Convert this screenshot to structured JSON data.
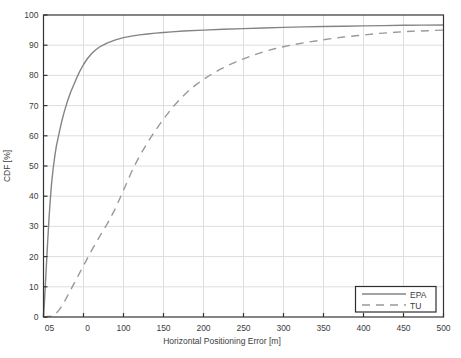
{
  "chart_data": {
    "type": "line",
    "title": "",
    "xlabel": "Horizontal Positioning Error [m]",
    "ylabel": "CDF [%]",
    "xlim": [
      0,
      500
    ],
    "ylim": [
      0,
      100
    ],
    "grid": true,
    "x_tick_values": [
      0,
      50,
      100,
      150,
      200,
      250,
      300,
      350,
      400,
      450,
      500
    ],
    "x_tick_labels": [
      "05",
      "0",
      "100",
      "150",
      "200",
      "250",
      "300",
      "350",
      "400",
      "450",
      "500"
    ],
    "y_tick_values": [
      0,
      10,
      20,
      30,
      40,
      50,
      60,
      70,
      80,
      90,
      100
    ],
    "y_tick_labels": [
      "0",
      "10",
      "20",
      "30",
      "40",
      "50",
      "60",
      "70",
      "80",
      "90",
      "100"
    ],
    "legend": {
      "position": "bottom-right",
      "entries": [
        {
          "label": "EPA",
          "line_style": "solid"
        },
        {
          "label": "TU",
          "line_style": "dashed"
        }
      ]
    },
    "series": [
      {
        "name": "EPA",
        "line_style": "solid",
        "color": "#848484",
        "points": [
          [
            0,
            0
          ],
          [
            1,
            4
          ],
          [
            2,
            9
          ],
          [
            3,
            14
          ],
          [
            4,
            19
          ],
          [
            5,
            24
          ],
          [
            6,
            28.5
          ],
          [
            7,
            33
          ],
          [
            8,
            37
          ],
          [
            9,
            40.5
          ],
          [
            10,
            44
          ],
          [
            12,
            49
          ],
          [
            14,
            53
          ],
          [
            16,
            56.5
          ],
          [
            18,
            59
          ],
          [
            20,
            61.5
          ],
          [
            23,
            65
          ],
          [
            26,
            68
          ],
          [
            30,
            71.5
          ],
          [
            34,
            74.5
          ],
          [
            38,
            77
          ],
          [
            42,
            79.5
          ],
          [
            46,
            81.7
          ],
          [
            50,
            83.6
          ],
          [
            55,
            85.6
          ],
          [
            60,
            87.2
          ],
          [
            65,
            88.4
          ],
          [
            70,
            89.4
          ],
          [
            75,
            90.1
          ],
          [
            80,
            90.8
          ],
          [
            90,
            91.8
          ],
          [
            100,
            92.5
          ],
          [
            110,
            93
          ],
          [
            120,
            93.4
          ],
          [
            130,
            93.7
          ],
          [
            140,
            94
          ],
          [
            150,
            94.2
          ],
          [
            160,
            94.4
          ],
          [
            175,
            94.7
          ],
          [
            200,
            95
          ],
          [
            225,
            95.3
          ],
          [
            250,
            95.5
          ],
          [
            275,
            95.7
          ],
          [
            300,
            95.9
          ],
          [
            325,
            96.05
          ],
          [
            350,
            96.2
          ],
          [
            375,
            96.3
          ],
          [
            400,
            96.4
          ],
          [
            425,
            96.5
          ],
          [
            450,
            96.6
          ],
          [
            475,
            96.65
          ],
          [
            500,
            96.7
          ]
        ]
      },
      {
        "name": "TU",
        "line_style": "dashed",
        "color": "#999999",
        "points": [
          [
            0,
            0
          ],
          [
            10,
            0.3
          ],
          [
            15,
            1
          ],
          [
            20,
            2.5
          ],
          [
            25,
            4.5
          ],
          [
            30,
            7
          ],
          [
            35,
            9.5
          ],
          [
            40,
            12
          ],
          [
            45,
            14.5
          ],
          [
            50,
            17
          ],
          [
            55,
            19.5
          ],
          [
            60,
            22
          ],
          [
            65,
            24.3
          ],
          [
            70,
            26.6
          ],
          [
            75,
            28.8
          ],
          [
            80,
            31
          ],
          [
            85,
            33.5
          ],
          [
            90,
            36
          ],
          [
            95,
            39
          ],
          [
            100,
            42
          ],
          [
            105,
            45
          ],
          [
            110,
            48
          ],
          [
            115,
            50.7
          ],
          [
            120,
            53.2
          ],
          [
            125,
            55.5
          ],
          [
            130,
            57.7
          ],
          [
            135,
            59.8
          ],
          [
            140,
            61.8
          ],
          [
            145,
            63.7
          ],
          [
            150,
            65.5
          ],
          [
            160,
            69
          ],
          [
            170,
            72
          ],
          [
            180,
            74.6
          ],
          [
            190,
            76.8
          ],
          [
            200,
            78.7
          ],
          [
            210,
            80.4
          ],
          [
            220,
            81.9
          ],
          [
            230,
            83.2
          ],
          [
            240,
            84.4
          ],
          [
            250,
            85.5
          ],
          [
            260,
            86.5
          ],
          [
            270,
            87.4
          ],
          [
            280,
            88.2
          ],
          [
            290,
            88.9
          ],
          [
            300,
            89.5
          ],
          [
            315,
            90.3
          ],
          [
            330,
            91
          ],
          [
            345,
            91.6
          ],
          [
            360,
            92.2
          ],
          [
            375,
            92.7
          ],
          [
            390,
            93.1
          ],
          [
            405,
            93.5
          ],
          [
            420,
            93.9
          ],
          [
            440,
            94.3
          ],
          [
            460,
            94.6
          ],
          [
            480,
            94.8
          ],
          [
            500,
            95
          ]
        ]
      }
    ]
  },
  "colors": {
    "background": "#ffffff",
    "grid": "#dedede",
    "axis": "#333333",
    "tick_text": "#3d3d3d",
    "legend_border": "#2e2e2e",
    "legend_background": "#ffffff"
  }
}
